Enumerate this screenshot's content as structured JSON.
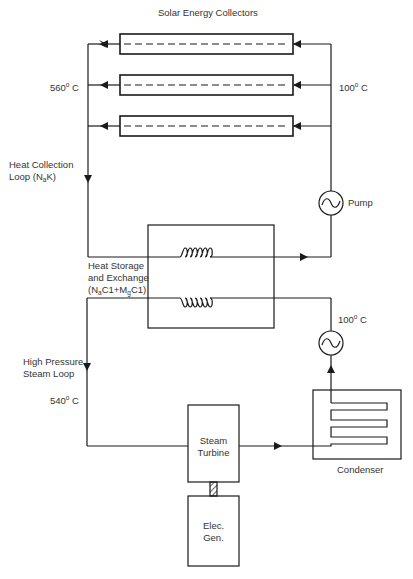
{
  "title": "Solar Energy Collectors",
  "labels": {
    "collector_outlet_temp": {
      "value": "560",
      "deg": "o",
      "unit": " C"
    },
    "collector_inlet_temp": {
      "value": "100",
      "deg": "o",
      "unit": " C"
    },
    "heat_collection_loop": {
      "line1": "Heat Collection",
      "line2_pre": "Loop (N",
      "line2_sub": "a",
      "line2_post": "K)"
    },
    "pump": "Pump",
    "heat_storage": {
      "line1": "Heat Storage",
      "line2": "and Exchange",
      "line3_a": "(N",
      "line3_sub1": "a",
      "line3_b": "C1+M",
      "line3_sub2": "g",
      "line3_c": "C1)"
    },
    "condensate_temp": {
      "value": "100",
      "deg": "o",
      "unit": " C"
    },
    "steam_loop": {
      "line1": "High Pressure",
      "line2": "Steam Loop"
    },
    "steam_temp": {
      "value": "540",
      "deg": "o",
      "unit": " C"
    },
    "steam_turbine": {
      "line1": "Steam",
      "line2": "Turbine"
    },
    "condenser": "Condenser",
    "generator": {
      "line1": "Elec.",
      "line2": "Gen."
    }
  },
  "components": {
    "collectors_count": 3,
    "stroke_color": "#1a1a1a"
  }
}
